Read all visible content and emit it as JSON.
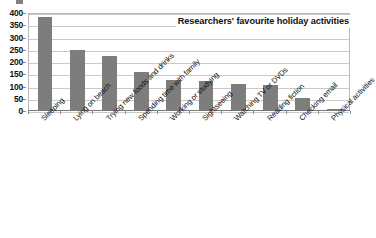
{
  "chart_data": {
    "type": "bar",
    "title": "Researchers' favourite holiday activities",
    "xlabel": "",
    "ylabel": "",
    "ylim": [
      0,
      400
    ],
    "yticks": [
      0,
      50,
      100,
      150,
      200,
      250,
      300,
      350,
      400
    ],
    "grid": true,
    "legend": "none",
    "title_position": "top-right inside plot area",
    "bar_color": "#7d7d7d",
    "categories": [
      "Sleeping",
      "Lying on beach",
      "Trying new foods and drinks",
      "Spending time with family",
      "Working or studying",
      "Sightseeing",
      "Watching TV or DVDs",
      "Reading fiction",
      "Checking email",
      "Physical activities"
    ],
    "values": [
      380,
      243,
      220,
      157,
      122,
      118,
      106,
      104,
      50,
      5
    ]
  },
  "axis": {
    "y_tick_labels": [
      "400",
      "350",
      "300",
      "250",
      "200",
      "150",
      "100",
      "50",
      "0"
    ]
  },
  "colors": {
    "bar": "#7d7d7d",
    "gridline": "#c9c9c9",
    "axis": "#7a7a7a",
    "text": "#111111",
    "background": "#ffffff"
  }
}
